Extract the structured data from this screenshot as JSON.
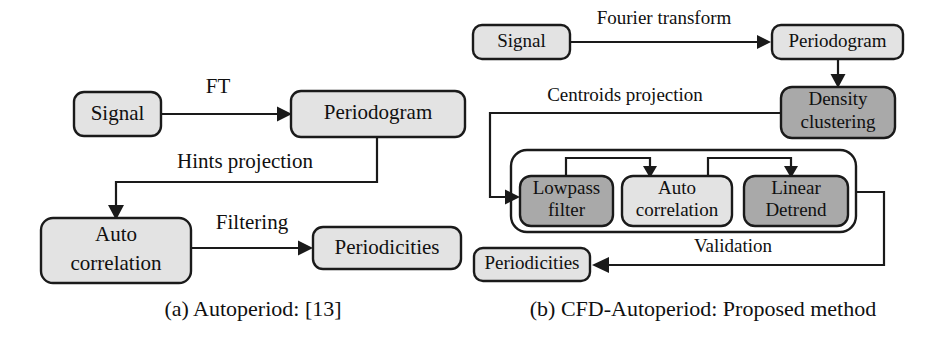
{
  "figure": {
    "background_color": "#ffffff",
    "line_color": "#1a1a1a",
    "fill_light": "#e3e3e3",
    "fill_dark": "#a9a9a9",
    "text_color": "#101010"
  },
  "panels": [
    {
      "id": "panel-a",
      "caption": "(a) Autoperiod: [13]",
      "nodes": [
        {
          "id": "a-signal",
          "label": "Signal",
          "shade": "light"
        },
        {
          "id": "a-periodogram",
          "label": "Periodogram",
          "shade": "light"
        },
        {
          "id": "a-autocorrelation",
          "label": "Auto\ncorrelation",
          "line1": "Auto",
          "line2": "correlation",
          "shade": "light"
        },
        {
          "id": "a-periodicities",
          "label": "Periodicities",
          "shade": "light"
        }
      ],
      "edges": [
        {
          "id": "a-edge-ft",
          "label": "FT",
          "from": "a-signal",
          "to": "a-periodogram"
        },
        {
          "id": "a-edge-hints",
          "label": "Hints projection",
          "from": "a-periodogram",
          "to": "a-autocorrelation"
        },
        {
          "id": "a-edge-filtering",
          "label": "Filtering",
          "from": "a-autocorrelation",
          "to": "a-periodicities"
        }
      ]
    },
    {
      "id": "panel-b",
      "caption": "(b) CFD-Autoperiod: Proposed method",
      "nodes": [
        {
          "id": "b-signal",
          "label": "Signal",
          "shade": "light"
        },
        {
          "id": "b-periodogram",
          "label": "Periodogram",
          "shade": "light"
        },
        {
          "id": "b-density-clustering",
          "label": "Density\nclustering",
          "line1": "Density",
          "line2": "clustering",
          "shade": "dark"
        },
        {
          "id": "b-lowpass-filter",
          "label": "Lowpass\nfilter",
          "line1": "Lowpass",
          "line2": "filter",
          "shade": "dark"
        },
        {
          "id": "b-auto-correlation",
          "label": "Auto\ncorrelation",
          "line1": "Auto",
          "line2": "correlation",
          "shade": "light"
        },
        {
          "id": "b-linear-detrend",
          "label": "Linear\nDetrend",
          "line1": "Linear",
          "line2": "Detrend",
          "shade": "dark"
        },
        {
          "id": "b-periodicities",
          "label": "Periodicities",
          "shade": "light"
        },
        {
          "id": "b-pipeline-group",
          "label": "",
          "shade": "none"
        }
      ],
      "edges": [
        {
          "id": "b-edge-fourier",
          "label": "Fourier transform",
          "from": "b-signal",
          "to": "b-periodogram"
        },
        {
          "id": "b-edge-periodogram-density",
          "label": "",
          "from": "b-periodogram",
          "to": "b-density-clustering"
        },
        {
          "id": "b-edge-centroids",
          "label": "Centroids projection",
          "from": "b-density-clustering",
          "to": "b-pipeline-group"
        },
        {
          "id": "b-edge-lowpass-auto",
          "label": "",
          "from": "b-lowpass-filter",
          "to": "b-auto-correlation"
        },
        {
          "id": "b-edge-auto-detrend",
          "label": "",
          "from": "b-auto-correlation",
          "to": "b-linear-detrend"
        },
        {
          "id": "b-edge-validation",
          "label": "Validation",
          "from": "b-pipeline-group",
          "to": "b-periodicities"
        }
      ]
    }
  ]
}
